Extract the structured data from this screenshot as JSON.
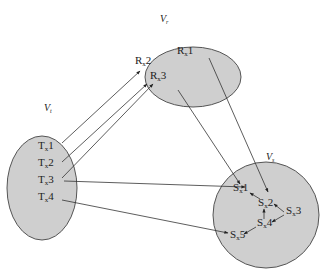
{
  "colors": {
    "set_fill": "#cfcfcf",
    "set_stroke": "#555555",
    "edge": "#333333",
    "background": "#ffffff"
  },
  "sets": {
    "vr": {
      "label": "V",
      "sub": "r"
    },
    "vt": {
      "label": "V",
      "sub": "t"
    },
    "vs": {
      "label": "V",
      "sub": "s"
    }
  },
  "nodes": {
    "rx1": {
      "label": "R",
      "sub": "x",
      "num": "1"
    },
    "rx2": {
      "label": "R",
      "sub": "x",
      "num": "2"
    },
    "rx3": {
      "label": "R",
      "sub": "x",
      "num": "3"
    },
    "tx1": {
      "label": "T",
      "sub": "x",
      "num": "1"
    },
    "tx2": {
      "label": "T",
      "sub": "x",
      "num": "2"
    },
    "tx3": {
      "label": "T",
      "sub": "x",
      "num": "3"
    },
    "tx4": {
      "label": "T",
      "sub": "x",
      "num": "4"
    },
    "sx1": {
      "label": "S",
      "sub": "x",
      "num": "1"
    },
    "sx2": {
      "label": "S",
      "sub": "x",
      "num": "2"
    },
    "sx3": {
      "label": "S",
      "sub": "x",
      "num": "3"
    },
    "sx4": {
      "label": "S",
      "sub": "x",
      "num": "4"
    },
    "sx5": {
      "label": "S",
      "sub": "x",
      "num": "5"
    }
  },
  "edges": [
    {
      "from": "Tx1",
      "to": "Rx2"
    },
    {
      "from": "Tx2",
      "to": "Rx3"
    },
    {
      "from": "Tx3",
      "to": "Rx3"
    },
    {
      "from": "Tx3",
      "to": "Sx1"
    },
    {
      "from": "Tx4",
      "to": "Sx5"
    },
    {
      "from": "Rx1",
      "to": "Sx2"
    },
    {
      "from": "Rx3",
      "to": "Sx1"
    },
    {
      "from": "Sx2",
      "to": "Sx1"
    },
    {
      "from": "Sx3",
      "to": "Sx2"
    },
    {
      "from": "Sx4",
      "to": "Sx2"
    },
    {
      "from": "Sx3",
      "to": "Sx4"
    },
    {
      "from": "Sx4",
      "to": "Sx5"
    }
  ]
}
